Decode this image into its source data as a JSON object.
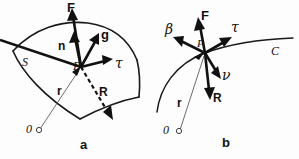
{
  "figure": {
    "caption_a": "a",
    "caption_b": "b",
    "colors": {
      "ink": "#111111",
      "thin_line": "#5c5c5c",
      "background": "#fdfdfd"
    }
  },
  "panel_a": {
    "name": "surface-element-diagram",
    "surface_label": "S",
    "point_label": "P",
    "origin_label": "0",
    "vectors": [
      {
        "id": "F",
        "label": "F",
        "style": "bold",
        "description": "force-vector"
      },
      {
        "id": "n",
        "label": "n",
        "style": "bold",
        "description": "normal-vector"
      },
      {
        "id": "g",
        "label": "g",
        "style": "bold",
        "description": "g-vector"
      },
      {
        "id": "tau",
        "label": "τ",
        "style": "bold",
        "description": "tangent-vector"
      },
      {
        "id": "R",
        "label": "R",
        "style": "dashed",
        "description": "position-vector-R"
      },
      {
        "id": "r",
        "label": "r",
        "style": "thin",
        "description": "radius-vector-r"
      }
    ]
  },
  "panel_b": {
    "name": "curve-element-diagram",
    "curve_label": "C",
    "point_label": "P",
    "origin_label": "0",
    "vectors": [
      {
        "id": "F",
        "label": "F",
        "style": "bold",
        "description": "force-vector"
      },
      {
        "id": "beta",
        "label": "β",
        "style": "bold",
        "description": "binormal-vector"
      },
      {
        "id": "tau",
        "label": "τ",
        "style": "bold",
        "description": "tangent-vector"
      },
      {
        "id": "nu",
        "label": "ν",
        "style": "bold",
        "description": "normal-vector-nu"
      },
      {
        "id": "R",
        "label": "R",
        "style": "bold",
        "description": "reaction-vector-R"
      },
      {
        "id": "r",
        "label": "r",
        "style": "thin",
        "description": "radius-vector-r"
      }
    ]
  }
}
